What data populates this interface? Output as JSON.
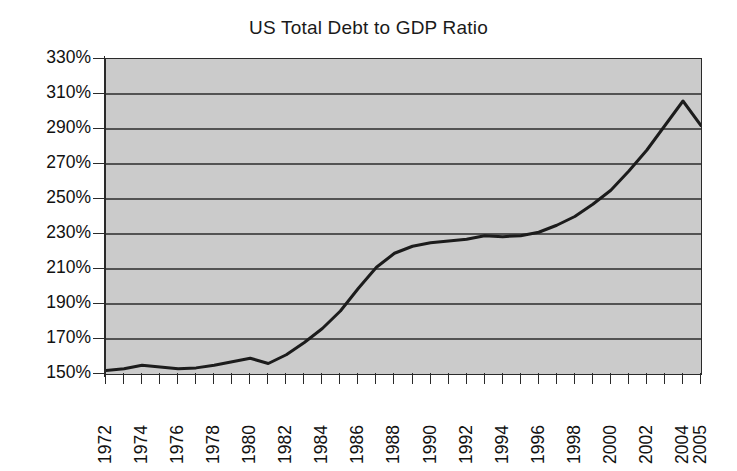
{
  "chart_data": {
    "type": "line",
    "title": "US Total Debt to GDP Ratio",
    "xlabel": "",
    "ylabel": "",
    "ylim": [
      150,
      330
    ],
    "ytick_step": 20,
    "ytick_labels": [
      "330%",
      "310%",
      "290%",
      "270%",
      "250%",
      "230%",
      "210%",
      "190%",
      "170%",
      "150%"
    ],
    "ytick_values": [
      330,
      310,
      290,
      270,
      250,
      230,
      210,
      190,
      170,
      150
    ],
    "xlim": [
      1972,
      2005
    ],
    "xtick_labels": [
      "1972",
      "1974",
      "1976",
      "1978",
      "1980",
      "1982",
      "1984",
      "1986",
      "1988",
      "1990",
      "1992",
      "1994",
      "1996",
      "1998",
      "2000",
      "2002",
      "2004",
      "2005"
    ],
    "xtick_label_values": [
      1972,
      1974,
      1976,
      1978,
      1980,
      1982,
      1984,
      1986,
      1988,
      1990,
      1992,
      1994,
      1996,
      1998,
      2000,
      2002,
      2004,
      2005
    ],
    "x": [
      1972,
      1973,
      1974,
      1975,
      1976,
      1977,
      1978,
      1979,
      1980,
      1981,
      1982,
      1983,
      1984,
      1985,
      1986,
      1987,
      1988,
      1989,
      1990,
      1991,
      1992,
      1993,
      1994,
      1995,
      1996,
      1997,
      1998,
      1999,
      2000,
      2001,
      2002,
      2003,
      2004,
      2005
    ],
    "values": [
      152,
      153,
      155,
      154,
      153,
      153.5,
      155,
      157,
      159,
      156,
      161,
      168,
      176,
      186,
      199,
      211,
      219,
      223,
      225,
      226,
      227,
      229,
      228.5,
      229,
      231,
      235,
      240,
      247,
      255,
      266,
      278,
      292,
      306,
      292
    ],
    "series": [
      {
        "name": "US Total Debt to GDP Ratio",
        "values": [
          152,
          153,
          155,
          154,
          153,
          153.5,
          155,
          157,
          159,
          156,
          161,
          168,
          176,
          186,
          199,
          211,
          219,
          223,
          225,
          226,
          227,
          229,
          228.5,
          229,
          231,
          235,
          240,
          247,
          255,
          266,
          278,
          292,
          306,
          292
        ]
      }
    ],
    "grid": "horizontal",
    "legend": "none",
    "plot_background_color": "#cbcbcb",
    "line_color": "#1c1c1c",
    "gridline_color": "#2b2b2b",
    "axis_color": "#2a2a2a",
    "annotations": []
  }
}
